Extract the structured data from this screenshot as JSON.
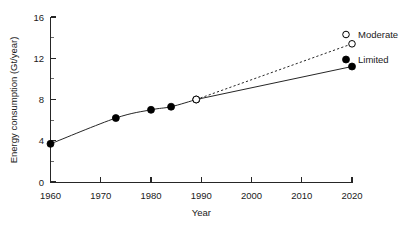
{
  "chart_data": {
    "type": "line",
    "title": "",
    "xlabel": "Year",
    "ylabel": "Energy consumption (Gt/year)",
    "xlim": [
      1955,
      2023
    ],
    "ylim": [
      0,
      16
    ],
    "grid": false,
    "legend_position": "right",
    "x_ticks": [
      1960,
      1970,
      1980,
      1990,
      2000,
      2010,
      2020
    ],
    "x_tick_labels": [
      "1960",
      "1970",
      "1980",
      "1990",
      "2000",
      "2010",
      "2020"
    ],
    "y_ticks": [
      0,
      4,
      8,
      12,
      16
    ],
    "y_tick_labels": [
      "0",
      "4",
      "8",
      "12",
      "16"
    ],
    "y_minor_ticks": [
      2,
      6,
      10,
      14
    ],
    "historical": {
      "name": "Historical",
      "marker": "filled-circle",
      "line": "solid",
      "x": [
        1960,
        1973,
        1980,
        1984,
        1989
      ],
      "y": [
        3.7,
        6.2,
        7.0,
        7.3,
        8.0
      ]
    },
    "series": [
      {
        "name": "Moderate",
        "marker": "open-circle",
        "line": "dashed",
        "x": [
          1989,
          2020
        ],
        "y": [
          8.0,
          13.4
        ]
      },
      {
        "name": "Limited",
        "marker": "filled-circle",
        "line": "solid",
        "x": [
          1989,
          2020
        ],
        "y": [
          8.0,
          11.2
        ]
      }
    ],
    "legend": [
      {
        "label": "Moderate",
        "marker": "open-circle",
        "line": "dashed"
      },
      {
        "label": "Limited",
        "marker": "filled-circle",
        "line": "solid"
      }
    ],
    "colors": {
      "axis": "#262626",
      "line": "#262626",
      "marker_fill": "#000000",
      "marker_open_fill": "#ffffff",
      "text": "#1a1a1a",
      "background": "#ffffff"
    }
  }
}
